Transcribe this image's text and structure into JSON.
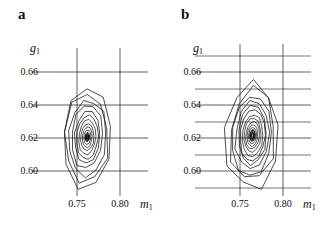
{
  "figure": {
    "background_color": "#ffffff",
    "line_color": "#111111",
    "panels": [
      {
        "id": "a",
        "label": "a",
        "axes": {
          "xlabel": "m",
          "xlabel_sub": "1",
          "ylabel": "g",
          "ylabel_sub": "1",
          "xticks": [
            "0.75",
            "0.80"
          ],
          "xtick_values": [
            0.75,
            0.8
          ],
          "yticks": [
            "0.66",
            "0.64",
            "0.62",
            "0.60"
          ],
          "ytick_values": [
            0.66,
            0.64,
            0.62,
            0.6
          ],
          "xlim": [
            0.718,
            0.818
          ],
          "ylim": [
            0.588,
            0.678
          ],
          "grid": true,
          "minor_grid": false
        }
      },
      {
        "id": "b",
        "label": "b",
        "axes": {
          "xlabel": "m",
          "xlabel_sub": "1",
          "ylabel": "g",
          "ylabel_sub": "1",
          "xticks": [
            "0.75",
            "0.80"
          ],
          "xtick_values": [
            0.75,
            0.8
          ],
          "yticks": [
            "0.66",
            "0.64",
            "0.62",
            "0.60"
          ],
          "ytick_values": [
            0.66,
            0.64,
            0.62,
            0.6
          ],
          "xlim": [
            0.718,
            0.818
          ],
          "ylim": [
            0.588,
            0.678
          ],
          "grid": true,
          "minor_grid": true
        }
      }
    ]
  },
  "chart_data": {
    "type": "line",
    "chart_kind": "contour",
    "title": "",
    "panels": [
      {
        "panel": "a",
        "xlabel": "m_1",
        "ylabel": "g_1",
        "xlim": [
          0.718,
          0.818
        ],
        "ylim": [
          0.588,
          0.678
        ],
        "xticks": [
          0.75,
          0.8
        ],
        "yticks": [
          0.6,
          0.62,
          0.64,
          0.66
        ],
        "center": [
          0.762,
          0.6205
        ],
        "orientation": "positively tilted elongated ellipse",
        "n_contour_levels": 12,
        "contours": [
          {
            "level": 1,
            "rx": 0.0295,
            "ry": 0.0315,
            "tilt_deg": -28
          },
          {
            "level": 2,
            "rx": 0.0252,
            "ry": 0.0272,
            "tilt_deg": -28
          },
          {
            "level": 3,
            "rx": 0.0215,
            "ry": 0.0234,
            "tilt_deg": -28
          },
          {
            "level": 4,
            "rx": 0.018,
            "ry": 0.0198,
            "tilt_deg": -28
          },
          {
            "level": 5,
            "rx": 0.015,
            "ry": 0.0166,
            "tilt_deg": -28
          },
          {
            "level": 6,
            "rx": 0.0122,
            "ry": 0.0137,
            "tilt_deg": -28
          },
          {
            "level": 7,
            "rx": 0.0097,
            "ry": 0.011,
            "tilt_deg": -28
          },
          {
            "level": 8,
            "rx": 0.0075,
            "ry": 0.0086,
            "tilt_deg": -28
          },
          {
            "level": 9,
            "rx": 0.0056,
            "ry": 0.0064,
            "tilt_deg": -28
          },
          {
            "level": 10,
            "rx": 0.0039,
            "ry": 0.0045,
            "tilt_deg": -28
          },
          {
            "level": 11,
            "rx": 0.0025,
            "ry": 0.0029,
            "tilt_deg": -28
          },
          {
            "level": 12,
            "rx": 0.0013,
            "ry": 0.0015,
            "tilt_deg": -28
          }
        ]
      },
      {
        "panel": "b",
        "xlabel": "m_1",
        "ylabel": "g_1",
        "xlim": [
          0.718,
          0.818
        ],
        "ylim": [
          0.588,
          0.678
        ],
        "xticks": [
          0.75,
          0.8
        ],
        "yticks": [
          0.6,
          0.62,
          0.64,
          0.66
        ],
        "center": [
          0.7645,
          0.6215
        ],
        "orientation": "positively tilted elongated ellipse",
        "n_contour_levels": 13,
        "contours": [
          {
            "level": 1,
            "rx": 0.03,
            "ry": 0.0325,
            "tilt_deg": -30
          },
          {
            "level": 2,
            "rx": 0.0262,
            "ry": 0.0286,
            "tilt_deg": -30
          },
          {
            "level": 3,
            "rx": 0.0228,
            "ry": 0.025,
            "tilt_deg": -30
          },
          {
            "level": 4,
            "rx": 0.0196,
            "ry": 0.0216,
            "tilt_deg": -30
          },
          {
            "level": 5,
            "rx": 0.0167,
            "ry": 0.0185,
            "tilt_deg": -30
          },
          {
            "level": 6,
            "rx": 0.0141,
            "ry": 0.0157,
            "tilt_deg": -30
          },
          {
            "level": 7,
            "rx": 0.0117,
            "ry": 0.0131,
            "tilt_deg": -30
          },
          {
            "level": 8,
            "rx": 0.0095,
            "ry": 0.0107,
            "tilt_deg": -30
          },
          {
            "level": 9,
            "rx": 0.0076,
            "ry": 0.0086,
            "tilt_deg": -30
          },
          {
            "level": 10,
            "rx": 0.0059,
            "ry": 0.0067,
            "tilt_deg": -30
          },
          {
            "level": 11,
            "rx": 0.0044,
            "ry": 0.005,
            "tilt_deg": -30
          },
          {
            "level": 12,
            "rx": 0.003,
            "ry": 0.0035,
            "tilt_deg": -30
          },
          {
            "level": 13,
            "rx": 0.0018,
            "ry": 0.0021,
            "tilt_deg": -30
          }
        ]
      }
    ]
  }
}
